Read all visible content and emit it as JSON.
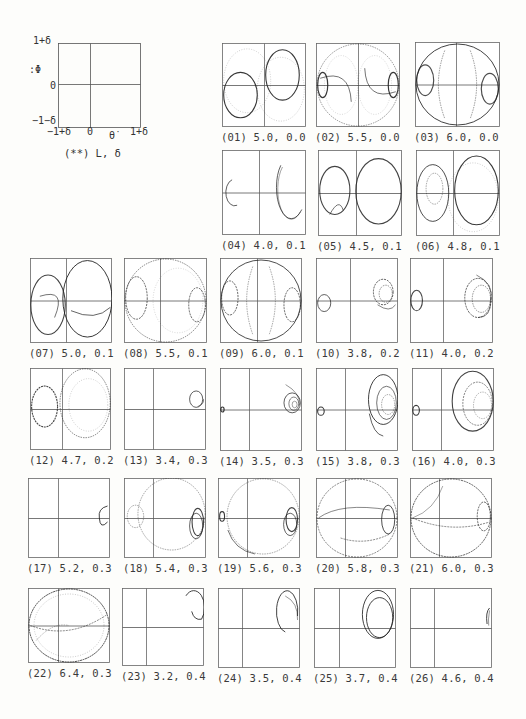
{
  "legend": {
    "y_top": "1+δ",
    "y_mid": "0",
    "y_bot": "−1−δ",
    "y_label": ":Φ",
    "x_left": "−1+δ",
    "x_mid": "0",
    "x_right": "1+δ",
    "x_label": "θ̇",
    "caption": "(**)  L,  δ"
  },
  "panels": [
    {
      "id": "01",
      "caption": "(01) 5.0, 0.0",
      "L": 5.0,
      "delta": 0.0
    },
    {
      "id": "02",
      "caption": "(02) 5.5, 0.0",
      "L": 5.5,
      "delta": 0.0
    },
    {
      "id": "03",
      "caption": "(03) 6.0, 0.0",
      "L": 6.0,
      "delta": 0.0
    },
    {
      "id": "04",
      "caption": "(04) 4.0, 0.1",
      "L": 4.0,
      "delta": 0.1
    },
    {
      "id": "05",
      "caption": "(05) 4.5, 0.1",
      "L": 4.5,
      "delta": 0.1
    },
    {
      "id": "06",
      "caption": "(06) 4.8, 0.1",
      "L": 4.8,
      "delta": 0.1
    },
    {
      "id": "07",
      "caption": "(07) 5.0, 0.1",
      "L": 5.0,
      "delta": 0.1
    },
    {
      "id": "08",
      "caption": "(08) 5.5, 0.1",
      "L": 5.5,
      "delta": 0.1
    },
    {
      "id": "09",
      "caption": "(09) 6.0, 0.1",
      "L": 6.0,
      "delta": 0.1
    },
    {
      "id": "10",
      "caption": "(10) 3.8, 0.2",
      "L": 3.8,
      "delta": 0.2
    },
    {
      "id": "11",
      "caption": "(11) 4.0, 0.2",
      "L": 4.0,
      "delta": 0.2
    },
    {
      "id": "12",
      "caption": "(12) 4.7, 0.2",
      "L": 4.7,
      "delta": 0.2
    },
    {
      "id": "13",
      "caption": "(13) 3.4, 0.3",
      "L": 3.4,
      "delta": 0.3
    },
    {
      "id": "14",
      "caption": "(14) 3.5, 0.3",
      "L": 3.5,
      "delta": 0.3
    },
    {
      "id": "15",
      "caption": "(15) 3.8, 0.3",
      "L": 3.8,
      "delta": 0.3
    },
    {
      "id": "16",
      "caption": "(16) 4.0, 0.3",
      "L": 4.0,
      "delta": 0.3
    },
    {
      "id": "17",
      "caption": "(17) 5.2, 0.3",
      "L": 5.2,
      "delta": 0.3
    },
    {
      "id": "18",
      "caption": "(18) 5.4, 0.3",
      "L": 5.4,
      "delta": 0.3
    },
    {
      "id": "19",
      "caption": "(19) 5.6, 0.3",
      "L": 5.6,
      "delta": 0.3
    },
    {
      "id": "20",
      "caption": "(20) 5.8, 0.3",
      "L": 5.8,
      "delta": 0.3
    },
    {
      "id": "21",
      "caption": "(21) 6.0, 0.3",
      "L": 6.0,
      "delta": 0.3
    },
    {
      "id": "22",
      "caption": "(22) 6.4, 0.3",
      "L": 6.4,
      "delta": 0.3
    },
    {
      "id": "23",
      "caption": "(23) 3.2, 0.4",
      "L": 3.2,
      "delta": 0.4
    },
    {
      "id": "24",
      "caption": "(24) 3.5, 0.4",
      "L": 3.5,
      "delta": 0.4
    },
    {
      "id": "25",
      "caption": "(25) 3.7, 0.4",
      "L": 3.7,
      "delta": 0.4
    },
    {
      "id": "26",
      "caption": "(26) 4.6, 0.4",
      "L": 4.6,
      "delta": 0.4
    }
  ]
}
